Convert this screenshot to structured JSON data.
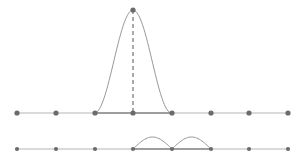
{
  "diagram": {
    "colors": {
      "background": "#ffffff",
      "axis_line": "#b4b4b4",
      "support_segment": "#8a8a8a",
      "curve": "#8c8c8c",
      "node": "#6b6b6b",
      "dashed_line": "#555555"
    },
    "nodes_x": [
      17,
      56,
      95,
      133,
      172,
      211,
      249,
      288
    ],
    "top_row": {
      "y": 113,
      "node_radius": 2.6,
      "support": [
        95,
        172
      ],
      "peak": {
        "x": 133,
        "y": 10
      }
    },
    "bottom_row": {
      "y": 149,
      "node_radius": 2.1,
      "support": [
        133,
        211
      ],
      "min": {
        "x": 153,
        "y": 161
      },
      "max": {
        "x": 185,
        "y": 137
      }
    }
  }
}
